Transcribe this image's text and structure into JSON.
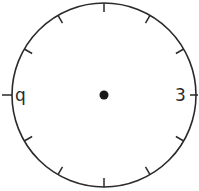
{
  "clock": {
    "title": "Blank clock face",
    "labels": {
      "left": "q",
      "right": "3"
    },
    "center": {
      "x": 104,
      "y": 95
    },
    "radius": 92,
    "center_dot_radius": 4.5,
    "stroke_color": "#2a2a2a",
    "tick_count": 12,
    "hands": []
  }
}
